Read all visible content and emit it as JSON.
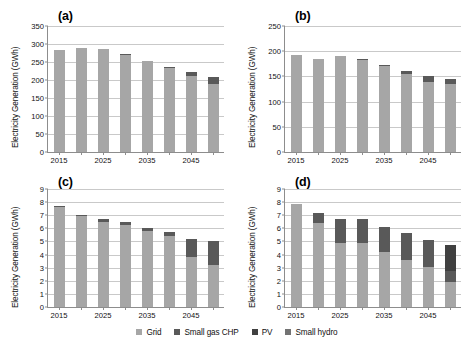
{
  "figure": {
    "ylabel": "Electricity Generation (GWh)",
    "series_colors": {
      "grid": "#a6a6a6",
      "small_gas_chp": "#595959",
      "pv": "#404040",
      "small_hydro": "#737373"
    }
  },
  "legend": {
    "items": [
      {
        "label": "Grid",
        "color": "#a6a6a6",
        "key": "grid"
      },
      {
        "label": "Small gas CHP",
        "color": "#595959",
        "key": "small_gas_chp"
      },
      {
        "label": "PV",
        "color": "#404040",
        "key": "pv"
      },
      {
        "label": "Small hydro",
        "color": "#737373",
        "key": "small_hydro"
      }
    ]
  },
  "chart_data": [
    {
      "id": "a",
      "type": "bar",
      "stacked": true,
      "title": "(a)",
      "xlabel": "",
      "ylabel": "Electricity Generation (GWh)",
      "ylim": [
        0,
        350
      ],
      "yticks": [
        0,
        50,
        100,
        150,
        200,
        250,
        300,
        350
      ],
      "grid": true,
      "legend_position": "bottom",
      "categories": [
        "2015",
        "2020",
        "2025",
        "2030",
        "2035",
        "2040",
        "2045",
        "2050"
      ],
      "tick_labels": [
        "2015",
        "",
        "2025",
        "",
        "2035",
        "",
        "2045",
        ""
      ],
      "series": [
        {
          "name": "Grid",
          "values": [
            283,
            288,
            286,
            270,
            252,
            234,
            210,
            190
          ]
        },
        {
          "name": "Small gas CHP",
          "values": [
            0.5,
            0.6,
            0.8,
            1.2,
            1.6,
            2.0,
            11,
            18
          ]
        },
        {
          "name": "PV",
          "values": [
            0,
            0,
            0,
            0,
            0,
            0,
            0,
            0
          ]
        },
        {
          "name": "Small hydro",
          "values": [
            0,
            0,
            0,
            0,
            0,
            0,
            0,
            0
          ]
        }
      ]
    },
    {
      "id": "b",
      "type": "bar",
      "stacked": true,
      "title": "(b)",
      "xlabel": "",
      "ylabel": "Electricity Generation (GWh)",
      "ylim": [
        0,
        250
      ],
      "yticks": [
        0,
        50,
        100,
        150,
        200,
        250
      ],
      "grid": true,
      "legend_position": "bottom",
      "categories": [
        "2015",
        "2020",
        "2025",
        "2030",
        "2035",
        "2040",
        "2045",
        "2050"
      ],
      "tick_labels": [
        "2015",
        "",
        "2025",
        "",
        "2035",
        "",
        "2045",
        ""
      ],
      "series": [
        {
          "name": "Grid",
          "values": [
            193,
            185,
            190,
            183,
            171,
            155,
            139,
            134
          ]
        },
        {
          "name": "Small gas CHP",
          "values": [
            0.4,
            0.5,
            0.6,
            0.8,
            1.0,
            5,
            12,
            11
          ]
        },
        {
          "name": "PV",
          "values": [
            0,
            0,
            0,
            0,
            0,
            0,
            0,
            0
          ]
        },
        {
          "name": "Small hydro",
          "values": [
            0,
            0,
            0,
            0,
            0,
            0,
            0,
            0
          ]
        }
      ]
    },
    {
      "id": "c",
      "type": "bar",
      "stacked": true,
      "title": "(c)",
      "xlabel": "",
      "ylabel": "Electricity Generation (GWh)",
      "ylim": [
        0,
        9
      ],
      "yticks": [
        0,
        1,
        2,
        3,
        4,
        5,
        6,
        7,
        8,
        9
      ],
      "grid": true,
      "legend_position": "bottom",
      "categories": [
        "2015",
        "2020",
        "2025",
        "2030",
        "2035",
        "2040",
        "2045",
        "2050"
      ],
      "tick_labels": [
        "2015",
        "",
        "2025",
        "",
        "2035",
        "",
        "2045",
        ""
      ],
      "series": [
        {
          "name": "Grid",
          "values": [
            7.65,
            6.93,
            6.52,
            6.28,
            5.78,
            5.45,
            3.78,
            3.22
          ]
        },
        {
          "name": "Small gas CHP",
          "values": [
            0.02,
            0.1,
            0.18,
            0.2,
            0.25,
            0.25,
            1.4,
            1.78
          ]
        },
        {
          "name": "PV",
          "values": [
            0,
            0,
            0,
            0,
            0,
            0,
            0,
            0
          ]
        },
        {
          "name": "Small hydro",
          "values": [
            0,
            0,
            0,
            0,
            0,
            0,
            0,
            0
          ]
        }
      ]
    },
    {
      "id": "d",
      "type": "bar",
      "stacked": true,
      "title": "(d)",
      "xlabel": "",
      "ylabel": "Electricity Generation (GWh)",
      "ylim": [
        0,
        9
      ],
      "yticks": [
        0,
        1,
        2,
        3,
        4,
        5,
        6,
        7,
        8,
        9
      ],
      "grid": true,
      "legend_position": "bottom",
      "categories": [
        "2015",
        "2020",
        "2025",
        "2030",
        "2035",
        "2040",
        "2045",
        "2050"
      ],
      "tick_labels": [
        "2015",
        "",
        "2025",
        "",
        "2035",
        "",
        "2045",
        ""
      ],
      "series": [
        {
          "name": "Grid",
          "values": [
            7.85,
            6.42,
            4.88,
            4.9,
            4.22,
            3.62,
            3.05,
            1.92
          ]
        },
        {
          "name": "Small gas CHP",
          "values": [
            0,
            0.72,
            1.85,
            1.85,
            1.9,
            2.02,
            2.05,
            0.85
          ]
        },
        {
          "name": "PV",
          "values": [
            0,
            0,
            0,
            0,
            0,
            0,
            0,
            1.95
          ]
        },
        {
          "name": "Small hydro",
          "values": [
            0,
            0,
            0,
            0,
            0,
            0,
            0,
            0
          ]
        }
      ]
    }
  ]
}
